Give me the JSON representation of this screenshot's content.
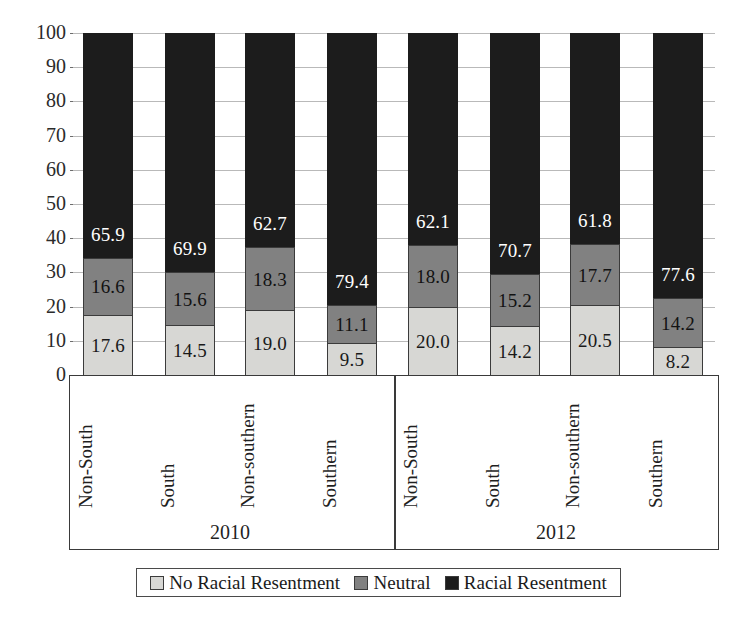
{
  "chart_data": {
    "type": "bar",
    "subtype": "stacked-100-percent",
    "title": "",
    "xlabel": "",
    "ylabel": "",
    "ylim": [
      0,
      100
    ],
    "yticks": [
      100,
      90,
      80,
      70,
      60,
      50,
      40,
      30,
      20,
      10,
      0
    ],
    "grid": true,
    "legend_position": "bottom",
    "group_labels": [
      "2010",
      "2012"
    ],
    "categories": [
      "Non-South",
      "South",
      "Non-southern",
      "Southern",
      "Non-South",
      "South",
      "Non-southern",
      "Southern"
    ],
    "series": [
      {
        "name": "No Racial Resentment",
        "color": "#d7d7d4",
        "values": [
          17.6,
          14.5,
          19.0,
          9.5,
          20.0,
          14.2,
          20.5,
          8.2
        ]
      },
      {
        "name": "Neutral",
        "color": "#818181",
        "values": [
          16.6,
          15.6,
          18.3,
          11.1,
          18.0,
          15.2,
          17.7,
          14.2
        ]
      },
      {
        "name": "Racial Resentment",
        "color": "#1c1c1c",
        "values": [
          65.9,
          69.9,
          62.7,
          79.4,
          62.1,
          70.7,
          61.8,
          77.6
        ]
      }
    ],
    "bars": [
      {
        "group": "2010",
        "category": "Non-South",
        "no_racial_resentment": 17.6,
        "neutral": 16.6,
        "racial_resentment": 65.9
      },
      {
        "group": "2010",
        "category": "South",
        "no_racial_resentment": 14.5,
        "neutral": 15.6,
        "racial_resentment": 69.9
      },
      {
        "group": "2010",
        "category": "Non-southern",
        "no_racial_resentment": 19.0,
        "neutral": 18.3,
        "racial_resentment": 62.7
      },
      {
        "group": "2010",
        "category": "Southern",
        "no_racial_resentment": 9.5,
        "neutral": 11.1,
        "racial_resentment": 79.4
      },
      {
        "group": "2012",
        "category": "Non-South",
        "no_racial_resentment": 20.0,
        "neutral": 18.0,
        "racial_resentment": 62.1
      },
      {
        "group": "2012",
        "category": "South",
        "no_racial_resentment": 14.2,
        "neutral": 15.2,
        "racial_resentment": 70.7
      },
      {
        "group": "2012",
        "category": "Non-southern",
        "no_racial_resentment": 20.5,
        "neutral": 17.7,
        "racial_resentment": 61.8
      },
      {
        "group": "2012",
        "category": "Southern",
        "no_racial_resentment": 8.2,
        "neutral": 14.2,
        "racial_resentment": 77.6
      }
    ],
    "value_labels": {
      "light": [
        "17.6",
        "14.5",
        "19.0",
        "9.5",
        "20.0",
        "14.2",
        "20.5",
        "8.2"
      ],
      "mid": [
        "16.6",
        "15.6",
        "18.3",
        "11.1",
        "18.0",
        "15.2",
        "17.7",
        "14.2"
      ],
      "dark": [
        "65.9",
        "69.9",
        "62.7",
        "79.4",
        "62.1",
        "70.7",
        "61.8",
        "77.6"
      ]
    }
  },
  "axis": {
    "yticks": [
      "100",
      "90",
      "80",
      "70",
      "60",
      "50",
      "40",
      "30",
      "20",
      "10",
      "0"
    ]
  },
  "groups": [
    {
      "label": "2010"
    },
    {
      "label": "2012"
    }
  ],
  "categories": [
    {
      "label": "Non-South"
    },
    {
      "label": "South"
    },
    {
      "label": "Non-southern"
    },
    {
      "label": "Southern"
    },
    {
      "label": "Non-South"
    },
    {
      "label": "South"
    },
    {
      "label": "Non-southern"
    },
    {
      "label": "Southern"
    }
  ],
  "legend": {
    "items": [
      {
        "label": "No Racial Resentment",
        "color": "#d7d7d4"
      },
      {
        "label": "Neutral",
        "color": "#818181"
      },
      {
        "label": "Racial Resentment",
        "color": "#1c1c1c"
      }
    ]
  }
}
